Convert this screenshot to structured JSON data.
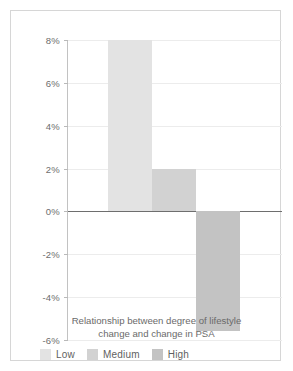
{
  "chart_data": {
    "type": "bar",
    "title": "",
    "caption_lines": [
      "Relationship between degree of lifestyle",
      "change and change in PSA"
    ],
    "caption": "Relationship between degree of lifestyle change and change in PSA",
    "categories": [
      "Low",
      "Medium",
      "High"
    ],
    "values": [
      8,
      2,
      -5.6
    ],
    "value_labels": [
      "8%",
      "2%",
      "-5.6%"
    ],
    "xlabel": "",
    "ylabel": "",
    "ylim": [
      -6,
      8
    ],
    "ytick_values": [
      8,
      6,
      4,
      2,
      0,
      -2,
      -4,
      -6
    ],
    "ytick_labels": [
      "8%",
      "6%",
      "4%",
      "2%",
      "0%",
      "-2%",
      "-4%",
      "-6%"
    ],
    "grid": true,
    "legend_position": "bottom-left",
    "series": [
      {
        "name": "Low",
        "value": 8,
        "color": "#e3e3e3"
      },
      {
        "name": "Medium",
        "value": 2,
        "color": "#d2d2d2"
      },
      {
        "name": "High",
        "value": -5.6,
        "color": "#c3c3c3"
      }
    ]
  },
  "legend": {
    "items": [
      {
        "label": "Low",
        "color": "#e3e3e3"
      },
      {
        "label": "Medium",
        "color": "#d2d2d2"
      },
      {
        "label": "High",
        "color": "#c3c3c3"
      }
    ]
  },
  "colors": {
    "low": "#e3e3e3",
    "medium": "#d2d2d2",
    "high": "#c3c3c3",
    "gridline": "#ececec",
    "zero_line": "#6e6e6e",
    "axis": "#c2c2c2",
    "text": "#6d6d6d",
    "frame": "#d6d6d6",
    "background": "#ffffff"
  }
}
